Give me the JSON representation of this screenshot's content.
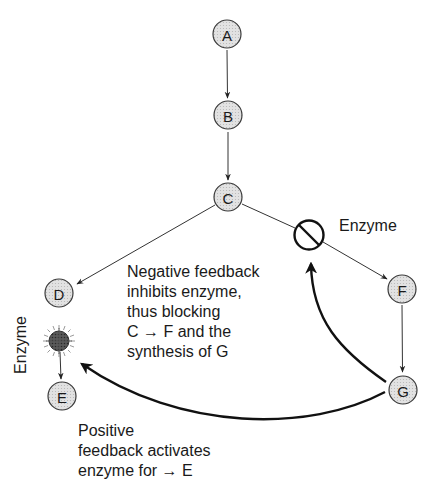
{
  "diagram": {
    "nodes": [
      {
        "id": "A",
        "label": "A"
      },
      {
        "id": "B",
        "label": "B"
      },
      {
        "id": "C",
        "label": "C"
      },
      {
        "id": "D",
        "label": "D"
      },
      {
        "id": "E",
        "label": "E"
      },
      {
        "id": "F",
        "label": "F"
      },
      {
        "id": "G",
        "label": "G"
      }
    ],
    "edges": [
      {
        "from": "A",
        "to": "B"
      },
      {
        "from": "B",
        "to": "C"
      },
      {
        "from": "C",
        "to": "D"
      },
      {
        "from": "C",
        "to": "F",
        "via": "inhibited-enzyme"
      },
      {
        "from": "F",
        "to": "G"
      },
      {
        "from": "activated-enzyme",
        "to": "E"
      },
      {
        "from": "G",
        "to": "inhibited-enzyme",
        "type": "negative-feedback"
      },
      {
        "from": "G",
        "to": "activated-enzyme",
        "type": "positive-feedback"
      }
    ],
    "labels": {
      "inhibited_enzyme": "Enzyme",
      "activated_enzyme": "Enzyme"
    },
    "negative_feedback": {
      "lines": [
        "Negative feedback",
        "inhibits enzyme,",
        "thus blocking",
        "C → F and the",
        "synthesis of G"
      ]
    },
    "positive_feedback": {
      "lines": [
        "Positive",
        "feedback activates",
        "enzyme for → E"
      ]
    }
  }
}
